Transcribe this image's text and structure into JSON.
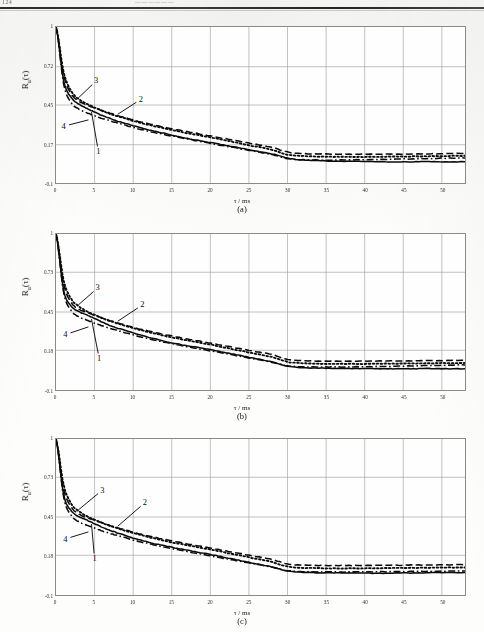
{
  "header": {
    "folio": "124",
    "running_title": "——————"
  },
  "figure": {
    "axis_y_label_html": "R<sub>u</sub>(τ)",
    "axis_x_label_html": "τ / ms",
    "curve_labels": [
      "1",
      "2",
      "3",
      "4"
    ],
    "line_styles": {
      "1": "solid",
      "2": "dashed",
      "3": "dotted",
      "4": "dash-dot"
    }
  },
  "panels": [
    {
      "id": "a",
      "caption": "(a)",
      "ylabel_html": "R<sub>u</sub>(τ)",
      "xlabel_html": "τ / ms",
      "yticks": [
        "1",
        "0.72",
        "0.45",
        "0.17",
        "-0.1"
      ],
      "xticks": [
        "0",
        "5",
        "10",
        "15",
        "20",
        "25",
        "30",
        "35",
        "40",
        "45",
        "50"
      ]
    },
    {
      "id": "b",
      "caption": "(b)",
      "ylabel_html": "R<sub>u</sub>(τ)",
      "xlabel_html": "τ / ms",
      "yticks": [
        "1",
        "0.73",
        "0.45",
        "0.18",
        "-0.1"
      ],
      "xticks": [
        "0",
        "5",
        "10",
        "15",
        "20",
        "25",
        "30",
        "35",
        "40",
        "45",
        "50"
      ]
    },
    {
      "id": "c",
      "caption": "(c)",
      "ylabel_html": "R<sub>u</sub>(τ)",
      "xlabel_html": "τ / ms",
      "yticks": [
        "1",
        "0.73",
        "0.45",
        "0.18",
        "-0.1"
      ],
      "xticks": [
        "0",
        "5",
        "10",
        "15",
        "20",
        "25",
        "30",
        "35",
        "40",
        "45",
        "50"
      ]
    }
  ],
  "chart_data": [
    {
      "type": "line",
      "panel": "a",
      "title": "(a)",
      "xlabel": "τ / ms",
      "ylabel": "R_u(τ)",
      "xlim": [
        0,
        53
      ],
      "ylim": [
        -0.1,
        1.0
      ],
      "ytick_values": [
        1.0,
        0.72,
        0.45,
        0.17,
        -0.1
      ],
      "xtick_values": [
        0,
        5,
        10,
        15,
        20,
        25,
        30,
        35,
        40,
        45,
        50
      ],
      "grid": true,
      "legend": "inline-numbered",
      "x": [
        0,
        1,
        2,
        3,
        4,
        5,
        6,
        7,
        8,
        10,
        12,
        14,
        16,
        18,
        20,
        22,
        24,
        26,
        28,
        30,
        32,
        34,
        36,
        38,
        40,
        42,
        44,
        46,
        48,
        50,
        53
      ],
      "series": [
        {
          "name": "1",
          "style": "solid",
          "values": [
            1.0,
            0.62,
            0.5,
            0.455,
            0.425,
            0.4,
            0.375,
            0.355,
            0.335,
            0.305,
            0.275,
            0.25,
            0.225,
            0.205,
            0.185,
            0.165,
            0.145,
            0.125,
            0.105,
            0.075,
            0.062,
            0.058,
            0.055,
            0.053,
            0.052,
            0.05,
            0.049,
            0.049,
            0.052,
            0.049,
            0.05
          ]
        },
        {
          "name": "2",
          "style": "dashed",
          "values": [
            1.0,
            0.66,
            0.525,
            0.475,
            0.45,
            0.43,
            0.41,
            0.392,
            0.375,
            0.345,
            0.318,
            0.295,
            0.272,
            0.252,
            0.232,
            0.212,
            0.192,
            0.172,
            0.152,
            0.118,
            0.108,
            0.105,
            0.104,
            0.103,
            0.103,
            0.103,
            0.104,
            0.105,
            0.106,
            0.107,
            0.108
          ]
        },
        {
          "name": "3",
          "style": "dotted",
          "values": [
            1.0,
            0.68,
            0.545,
            0.49,
            0.458,
            0.432,
            0.408,
            0.388,
            0.37,
            0.338,
            0.31,
            0.285,
            0.262,
            0.242,
            0.222,
            0.2,
            0.178,
            0.156,
            0.134,
            0.1,
            0.09,
            0.086,
            0.085,
            0.084,
            0.084,
            0.085,
            0.086,
            0.087,
            0.089,
            0.09,
            0.092
          ]
        },
        {
          "name": "4",
          "style": "dash-dot",
          "values": [
            1.0,
            0.595,
            0.465,
            0.42,
            0.395,
            0.375,
            0.355,
            0.338,
            0.322,
            0.292,
            0.265,
            0.242,
            0.22,
            0.2,
            0.18,
            0.16,
            0.14,
            0.12,
            0.1,
            0.072,
            0.064,
            0.062,
            0.062,
            0.063,
            0.064,
            0.066,
            0.068,
            0.07,
            0.072,
            0.074,
            0.077
          ]
        }
      ],
      "annotations": [
        {
          "label": "3",
          "x": 5.2,
          "y": 0.62
        },
        {
          "label": "2",
          "x": 11.0,
          "y": 0.49
        },
        {
          "label": "4",
          "x": 1.0,
          "y": 0.3
        },
        {
          "label": "1",
          "x": 5.5,
          "y": 0.12
        }
      ]
    },
    {
      "type": "line",
      "panel": "b",
      "title": "(b)",
      "xlabel": "τ / ms",
      "ylabel": "R_u(τ)",
      "xlim": [
        0,
        53
      ],
      "ylim": [
        -0.1,
        1.0
      ],
      "ytick_values": [
        1.0,
        0.73,
        0.45,
        0.18,
        -0.1
      ],
      "xtick_values": [
        0,
        5,
        10,
        15,
        20,
        25,
        30,
        35,
        40,
        45,
        50
      ],
      "grid": true,
      "legend": "inline-numbered",
      "x": [
        0,
        1,
        2,
        3,
        4,
        5,
        6,
        7,
        8,
        10,
        12,
        14,
        16,
        18,
        20,
        22,
        24,
        26,
        28,
        30,
        32,
        34,
        36,
        38,
        40,
        42,
        44,
        46,
        48,
        50,
        53
      ],
      "series": [
        {
          "name": "1",
          "style": "solid",
          "values": [
            1.0,
            0.6,
            0.49,
            0.452,
            0.428,
            0.405,
            0.378,
            0.355,
            0.335,
            0.302,
            0.272,
            0.245,
            0.222,
            0.205,
            0.185,
            0.163,
            0.142,
            0.12,
            0.098,
            0.068,
            0.058,
            0.055,
            0.053,
            0.052,
            0.051,
            0.05,
            0.05,
            0.05,
            0.051,
            0.05,
            0.05
          ]
        },
        {
          "name": "2",
          "style": "dashed",
          "values": [
            1.0,
            0.645,
            0.515,
            0.468,
            0.445,
            0.428,
            0.408,
            0.39,
            0.373,
            0.342,
            0.315,
            0.292,
            0.27,
            0.25,
            0.23,
            0.21,
            0.19,
            0.17,
            0.15,
            0.115,
            0.106,
            0.104,
            0.103,
            0.103,
            0.103,
            0.104,
            0.105,
            0.106,
            0.107,
            0.108,
            0.109
          ]
        },
        {
          "name": "3",
          "style": "dotted",
          "values": [
            1.0,
            0.672,
            0.54,
            0.488,
            0.455,
            0.43,
            0.406,
            0.386,
            0.368,
            0.336,
            0.308,
            0.283,
            0.26,
            0.24,
            0.22,
            0.198,
            0.176,
            0.154,
            0.132,
            0.098,
            0.088,
            0.085,
            0.084,
            0.084,
            0.084,
            0.085,
            0.086,
            0.087,
            0.088,
            0.09,
            0.091
          ]
        },
        {
          "name": "4",
          "style": "dash-dot",
          "values": [
            1.0,
            0.585,
            0.458,
            0.415,
            0.392,
            0.372,
            0.352,
            0.335,
            0.318,
            0.288,
            0.262,
            0.238,
            0.216,
            0.196,
            0.176,
            0.156,
            0.136,
            0.116,
            0.096,
            0.07,
            0.063,
            0.062,
            0.062,
            0.063,
            0.064,
            0.066,
            0.068,
            0.07,
            0.072,
            0.074,
            0.076
          ]
        }
      ],
      "annotations": [
        {
          "label": "3",
          "x": 5.4,
          "y": 0.62
        },
        {
          "label": "2",
          "x": 11.2,
          "y": 0.5
        },
        {
          "label": "4",
          "x": 1.2,
          "y": 0.29
        },
        {
          "label": "1",
          "x": 5.6,
          "y": 0.12
        }
      ]
    },
    {
      "type": "line",
      "panel": "c",
      "title": "(c)",
      "xlabel": "τ / ms",
      "ylabel": "R_u(τ)",
      "xlim": [
        0,
        53
      ],
      "ylim": [
        -0.1,
        1.0
      ],
      "ytick_values": [
        1.0,
        0.73,
        0.45,
        0.18,
        -0.1
      ],
      "xtick_values": [
        0,
        5,
        10,
        15,
        20,
        25,
        30,
        35,
        40,
        45,
        50
      ],
      "grid": true,
      "legend": "inline-numbered",
      "x": [
        0,
        1,
        2,
        3,
        4,
        5,
        6,
        7,
        8,
        10,
        12,
        14,
        16,
        18,
        20,
        22,
        24,
        26,
        28,
        30,
        32,
        34,
        36,
        38,
        40,
        42,
        44,
        46,
        48,
        50,
        53
      ],
      "series": [
        {
          "name": "1",
          "style": "solid",
          "values": [
            1.0,
            0.605,
            0.492,
            0.452,
            0.428,
            0.402,
            0.378,
            0.356,
            0.336,
            0.302,
            0.272,
            0.248,
            0.226,
            0.206,
            0.186,
            0.164,
            0.142,
            0.12,
            0.098,
            0.07,
            0.06,
            0.057,
            0.056,
            0.055,
            0.054,
            0.054,
            0.055,
            0.056,
            0.057,
            0.058,
            0.058
          ]
        },
        {
          "name": "2",
          "style": "dashed",
          "values": [
            1.0,
            0.648,
            0.518,
            0.47,
            0.446,
            0.428,
            0.409,
            0.391,
            0.374,
            0.343,
            0.316,
            0.293,
            0.271,
            0.251,
            0.231,
            0.211,
            0.191,
            0.171,
            0.151,
            0.118,
            0.11,
            0.108,
            0.108,
            0.108,
            0.109,
            0.11,
            0.11,
            0.111,
            0.112,
            0.112,
            0.113
          ]
        },
        {
          "name": "3",
          "style": "dotted",
          "values": [
            1.0,
            0.675,
            0.542,
            0.489,
            0.456,
            0.431,
            0.407,
            0.387,
            0.369,
            0.337,
            0.309,
            0.284,
            0.261,
            0.241,
            0.221,
            0.199,
            0.177,
            0.155,
            0.133,
            0.1,
            0.092,
            0.089,
            0.088,
            0.088,
            0.088,
            0.089,
            0.09,
            0.091,
            0.092,
            0.093,
            0.094
          ]
        },
        {
          "name": "4",
          "style": "dash-dot",
          "values": [
            1.0,
            0.588,
            0.46,
            0.416,
            0.392,
            0.372,
            0.352,
            0.334,
            0.318,
            0.288,
            0.262,
            0.238,
            0.216,
            0.196,
            0.176,
            0.156,
            0.136,
            0.116,
            0.096,
            0.072,
            0.065,
            0.063,
            0.063,
            0.063,
            0.063,
            0.064,
            0.065,
            0.066,
            0.067,
            0.068,
            0.07
          ]
        }
      ],
      "annotations": [
        {
          "label": "3",
          "x": 6.0,
          "y": 0.64
        },
        {
          "label": "2",
          "x": 11.5,
          "y": 0.55
        },
        {
          "label": "4",
          "x": 1.2,
          "y": 0.295
        },
        {
          "label": "1",
          "x": 5.0,
          "y": 0.155
        }
      ]
    }
  ]
}
